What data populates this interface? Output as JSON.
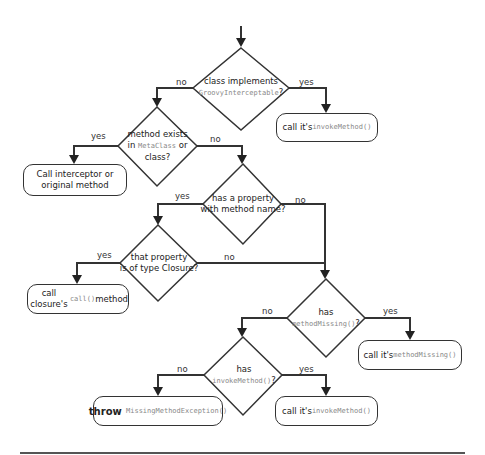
{
  "diagram": {
    "type": "flowchart",
    "decisions": [
      {
        "id": "d1",
        "line1": "class implements",
        "code": "GroovyInterceptable",
        "suffix": "?"
      },
      {
        "id": "d2",
        "line1": "method exists",
        "line2_prefix": "in ",
        "code": "MetaClass",
        "line2_suffix": " or",
        "line3": "class?"
      },
      {
        "id": "d3",
        "line1": "has a property",
        "line2": "with method name?"
      },
      {
        "id": "d4",
        "line1": "that property",
        "line2": "is of type Closure?"
      },
      {
        "id": "d5",
        "line1": "has",
        "code": "methodMissing()",
        "suffix": "?"
      },
      {
        "id": "d6",
        "line1": "has",
        "code": "invokeMethod()",
        "suffix": "?"
      }
    ],
    "actions": [
      {
        "id": "a1",
        "prefix": "call it's ",
        "code": "invokeMethod()"
      },
      {
        "id": "a2",
        "line1": "Call interceptor or",
        "line2": "original method"
      },
      {
        "id": "a3",
        "prefix": "call closure's ",
        "code": "call()",
        "suffix": " method"
      },
      {
        "id": "a4",
        "prefix": "call it's ",
        "code": "methodMissing()"
      },
      {
        "id": "a5",
        "bold": "throw",
        "code": " MissingMethodException()"
      },
      {
        "id": "a6",
        "prefix": "call it's ",
        "code": "invokeMethod()"
      }
    ],
    "edge_labels": {
      "d1_no": "no",
      "d1_yes": "yes",
      "d2_yes": "yes",
      "d2_no": "no",
      "d3_yes": "yes",
      "d3_no": "no",
      "d4_yes": "yes",
      "d4_no": "no",
      "d5_no": "no",
      "d5_yes": "yes",
      "d6_no": "no",
      "d6_yes": "yes"
    },
    "edges": [
      [
        "start",
        "d1"
      ],
      [
        "d1",
        "a1",
        "yes"
      ],
      [
        "d1",
        "d2",
        "no"
      ],
      [
        "d2",
        "a2",
        "yes"
      ],
      [
        "d2",
        "d3",
        "no"
      ],
      [
        "d3",
        "d4",
        "yes"
      ],
      [
        "d3",
        "d5",
        "no"
      ],
      [
        "d4",
        "a3",
        "yes"
      ],
      [
        "d4",
        "d5",
        "no"
      ],
      [
        "d5",
        "a4",
        "yes"
      ],
      [
        "d5",
        "d6",
        "no"
      ],
      [
        "d6",
        "a6",
        "yes"
      ],
      [
        "d6",
        "a5",
        "no"
      ]
    ],
    "colors": {
      "stroke": "#333333",
      "code_text": "#888888",
      "background": "#ffffff"
    }
  }
}
